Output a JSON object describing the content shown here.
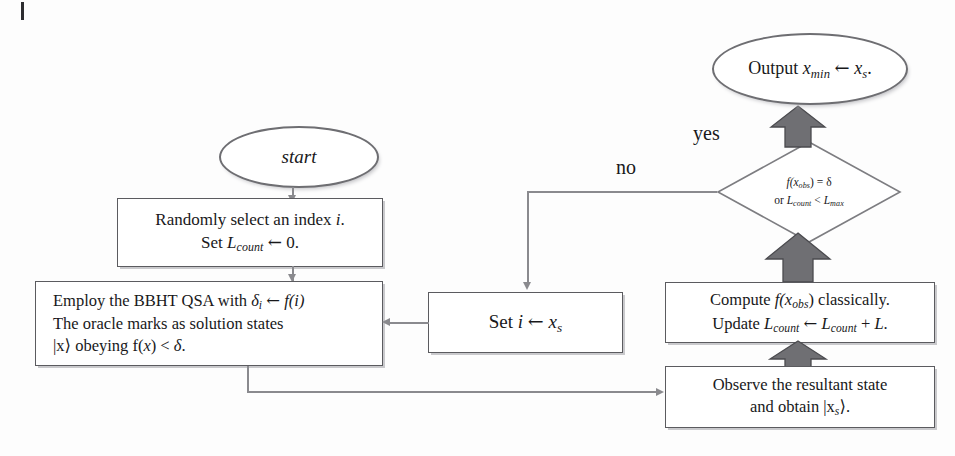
{
  "diagram": {
    "colors": {
      "page_background": "#fdfdfd",
      "node_outline": "#5b5b5f",
      "ellipse_outline": "#6e6e72",
      "connector": "#8a8a8e",
      "block_arrow_fill": "#6f6f73",
      "block_arrow_outline": "#4b4b4f",
      "text": "#18181a"
    },
    "nodes": {
      "start": {
        "shape": "ellipse",
        "label": "start"
      },
      "init": {
        "shape": "rectangle",
        "line1_pre": "Randomly select an index ",
        "line1_var": "i",
        "line1_post": ".",
        "line2_pre": "Set ",
        "line2_var": "L",
        "line2_sub": "count",
        "line2_arrow": "←",
        "line2_post": "0."
      },
      "bbht": {
        "shape": "rectangle",
        "line1_a": "Employ the BBHT QSA with ",
        "line1_delta": "δ",
        "line1_deltasub": "i",
        "line1_arrow": "←",
        "line1_f": "f",
        "line1_fi": "(i)",
        "line2": "The oracle marks as solution states",
        "line3_ket": "|x⟩",
        "line3_mid": " obeying f(",
        "line3_x": "x",
        "line3_cmp": ") < ",
        "line3_delta": "δ",
        "line3_end": "."
      },
      "observe": {
        "shape": "rectangle",
        "line1": "Observe the resultant state",
        "line2_pre": "and obtain ",
        "line2_ket": "|x",
        "line2_sub": "s",
        "line2_post": "⟩."
      },
      "compute": {
        "shape": "rectangle",
        "line1_pre": "Compute ",
        "line1_f": "f",
        "line1_x": "(x",
        "line1_sub": "obs",
        "line1_post": ") classically.",
        "line2_pre": "Update ",
        "line2_L1": "L",
        "line2_sub1": "count",
        "line2_arrow": "←",
        "line2_L2": "L",
        "line2_sub2": "count",
        "line2_plus": "+ ",
        "line2_L3": "L",
        "line2_end": "."
      },
      "decision": {
        "shape": "diamond",
        "line1_f": "f",
        "line1_x": "(x",
        "line1_sub": "obs",
        "line1_eq": ") = ",
        "line1_delta": "δ",
        "line2_or": "or ",
        "line2_L1": "L",
        "line2_sub1": "count",
        "line2_lt": " < ",
        "line2_L2": "L",
        "line2_sub2": "max"
      },
      "setibox": {
        "shape": "rectangle",
        "pre": "Set ",
        "var_i": "i",
        "arrow": "←",
        "var_x": "x",
        "sub": "s"
      },
      "output": {
        "shape": "ellipse",
        "pre": "Output ",
        "var_x": "x",
        "sub_min": "min",
        "arrow": "←",
        "var_xs": "x",
        "sub_s": "s",
        "end": "."
      }
    },
    "edge_labels": {
      "yes": "yes",
      "no": "no"
    }
  }
}
